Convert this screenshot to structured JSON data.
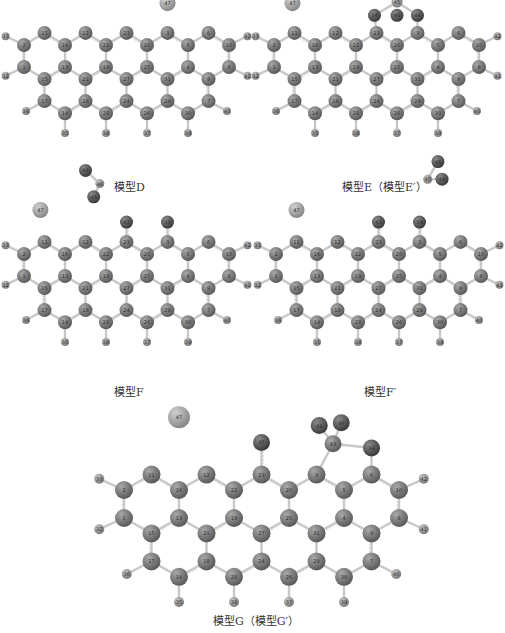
{
  "figure": {
    "panels": [
      {
        "id": "D",
        "caption": "模型D"
      },
      {
        "id": "E",
        "caption": "模型E（模型E′）"
      },
      {
        "id": "F",
        "caption": "模型F"
      },
      {
        "id": "F_prime",
        "caption": "模型F′"
      },
      {
        "id": "G",
        "caption": "模型G（模型G′）"
      }
    ],
    "colors": {
      "carbon": "#6e6e6e",
      "hydrogen": "#8a8a8a",
      "oxygen": "#4a4a4a",
      "metal": "#9a9a9a",
      "bond": "#c8c8c8"
    },
    "model_G_atoms": {
      "ring_carbons": [
        "1",
        "2",
        "3",
        "4",
        "5",
        "6",
        "7",
        "8",
        "9",
        "10",
        "11",
        "12",
        "13",
        "14",
        "15",
        "16",
        "17",
        "18",
        "19",
        "20",
        "21",
        "22",
        "23",
        "24",
        "25",
        "26",
        "27",
        "28",
        "29",
        "30",
        "31"
      ],
      "hydrogens": [
        "32",
        "33",
        "35",
        "36",
        "37",
        "38",
        "39",
        "40",
        "41",
        "42"
      ],
      "oxygens": [
        "34",
        "43",
        "44",
        "45",
        "46"
      ],
      "metal": "47"
    }
  }
}
